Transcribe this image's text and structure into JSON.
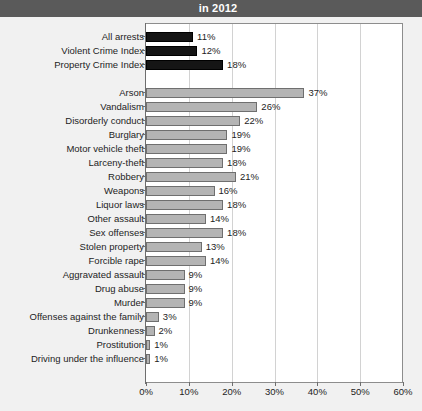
{
  "header": {
    "title": "in 2012"
  },
  "chart_data": {
    "type": "bar",
    "orientation": "horizontal",
    "title": "in 2012",
    "xlabel": "",
    "ylabel": "",
    "xlim": [
      0,
      60
    ],
    "xticks": [
      "0%",
      "10%",
      "20%",
      "30%",
      "40%",
      "50%",
      "60%"
    ],
    "xtick_values": [
      0,
      10,
      20,
      30,
      40,
      50,
      60
    ],
    "grid": true,
    "legend": "none",
    "colors": {
      "summary_bar": "#151515",
      "offense_bar": "#b4b4b4",
      "title_bar": "#5a5a5a",
      "plot_background": "#ffffff",
      "page_background": "#f1f1f1",
      "gridline": "#d2d2d2"
    },
    "groups": [
      {
        "name": "summary",
        "style": "dark",
        "categories": [
          "All arrests",
          "Violent Crime Index",
          "Property Crime Index"
        ],
        "values": [
          11,
          12,
          18
        ],
        "labels": [
          "11%",
          "12%",
          "18%"
        ]
      },
      {
        "name": "offenses",
        "style": "gray",
        "categories": [
          "Arson",
          "Vandalism",
          "Disorderly conduct",
          "Burglary",
          "Motor vehicle theft",
          "Larceny-theft",
          "Robbery",
          "Weapons",
          "Liquor laws",
          "Other assault",
          "Sex offenses",
          "Stolen property",
          "Forcible rape",
          "Aggravated assault",
          "Drug abuse",
          "Murder",
          "Offenses against the family",
          "Drunkenness",
          "Prostitution",
          "Driving under the influence"
        ],
        "values": [
          37,
          26,
          22,
          19,
          19,
          18,
          21,
          16,
          18,
          14,
          18,
          13,
          14,
          9,
          9,
          9,
          3,
          2,
          1,
          1
        ],
        "labels": [
          "37%",
          "26%",
          "22%",
          "19%",
          "19%",
          "18%",
          "21%",
          "16%",
          "18%",
          "14%",
          "18%",
          "13%",
          "14%",
          "9%",
          "9%",
          "9%",
          "3%",
          "2%",
          "1%",
          "1%"
        ]
      }
    ]
  }
}
